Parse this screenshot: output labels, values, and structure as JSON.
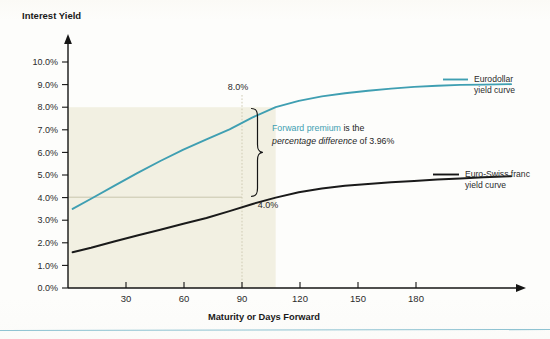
{
  "chart_data": {
    "type": "line",
    "title": "",
    "ylabel": "Interest Yield",
    "xlabel": "Maturity or Days Forward",
    "xlim": [
      0,
      195
    ],
    "ylim": [
      0,
      10
    ],
    "xticks": [
      30,
      60,
      90,
      120,
      150,
      180
    ],
    "xticklabels": [
      "30",
      "60",
      "90",
      "120",
      "150",
      "180"
    ],
    "yticks": [
      0,
      1,
      2,
      3,
      4,
      5,
      6,
      7,
      8,
      9,
      10
    ],
    "yticklabels": [
      "0.0%",
      "1.0%",
      "2.0%",
      "3.0%",
      "4.0%",
      "5.0%",
      "6.0%",
      "7.0%",
      "8.0%",
      "9.0%",
      "10.0%"
    ],
    "grid": false,
    "legend_position": "right-inline",
    "series": [
      {
        "name": "Eurodollar yield curve",
        "color": "#3f9fb2",
        "x": [
          2,
          10,
          20,
          30,
          40,
          50,
          60,
          70,
          80,
          90,
          100,
          110,
          120,
          130,
          140,
          150,
          160,
          170,
          180,
          192
        ],
        "y": [
          3.5,
          3.95,
          4.52,
          5.08,
          5.62,
          6.12,
          6.58,
          7.02,
          7.55,
          8.0,
          8.28,
          8.48,
          8.62,
          8.73,
          8.82,
          8.9,
          8.95,
          8.99,
          9.0,
          9.02
        ]
      },
      {
        "name": "Euro-Swiss franc yield curve",
        "color": "#1a1a1a",
        "x": [
          2,
          10,
          20,
          30,
          40,
          50,
          60,
          70,
          80,
          90,
          100,
          110,
          120,
          130,
          140,
          150,
          160,
          170,
          180,
          192
        ],
        "y": [
          1.58,
          1.78,
          2.06,
          2.32,
          2.58,
          2.84,
          3.1,
          3.4,
          3.72,
          4.0,
          4.24,
          4.4,
          4.52,
          4.6,
          4.68,
          4.74,
          4.8,
          4.85,
          4.9,
          4.95
        ]
      }
    ],
    "annotations": [
      {
        "name": "eurodollar-90day-value",
        "text": "8.0%",
        "x": 90,
        "y": 8.0
      },
      {
        "name": "euroswiss-90day-value",
        "text": "4.0%",
        "x": 90,
        "y": 4.0
      }
    ],
    "callout": {
      "lead_teal": "Forward premium",
      "mid_plain": " is the",
      "emphasis_italic": "percentage difference",
      "tail_plain": " of 3.96%",
      "spread_value": "3.96%",
      "bracket_from": 4.0,
      "bracket_to": 8.0,
      "at_maturity": 90
    },
    "shaded_region": {
      "x_from": 0,
      "x_to": 90,
      "y_from": 0,
      "y_to": 8.0,
      "color": "#f2f0e2"
    },
    "marker_lines": [
      {
        "name": "ninety-day-vertical",
        "orientation": "vertical",
        "value": 90
      },
      {
        "name": "four-percent-horizontal",
        "orientation": "horizontal",
        "value": 4.0
      }
    ]
  },
  "legend": [
    {
      "label_line1": "Eurodollar",
      "label_line2": "yield curve",
      "color": "#3f9fb2"
    },
    {
      "label_line1": "Euro-Swiss franc",
      "label_line2": "yield curve",
      "color": "#1a1a1a"
    }
  ]
}
